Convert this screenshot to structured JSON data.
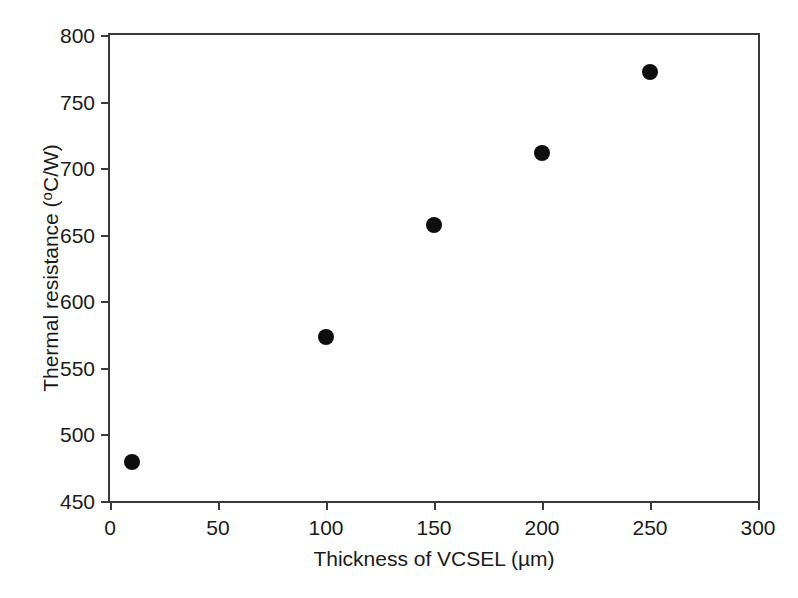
{
  "chart_data": {
    "type": "scatter",
    "title": "",
    "xlabel": "Thickness of VCSEL (µm)",
    "ylabel": "Thermal resistance (°C/W)",
    "ylabel_parts": {
      "text": "Thermal resistance (",
      "sup": "o",
      "tail": "C/W)"
    },
    "xlim": [
      0,
      300
    ],
    "ylim": [
      450,
      800
    ],
    "xticks": [
      0,
      50,
      100,
      150,
      200,
      250,
      300
    ],
    "xticklabels": [
      "0",
      "50",
      "100",
      "150",
      "200",
      "250",
      "300"
    ],
    "yticks": [
      450,
      500,
      550,
      600,
      650,
      700,
      750,
      800
    ],
    "yticklabels": [
      "450",
      "500",
      "550",
      "600",
      "650",
      "700",
      "750",
      "800"
    ],
    "grid": false,
    "legend": false,
    "legend_position": "none",
    "marker": "filled-circle",
    "marker_color": "#0d0d0d",
    "marker_size_px": 16,
    "axis_color": "#3a3a3a",
    "background_color": "#ffffff",
    "x": [
      10,
      100,
      150,
      200,
      250
    ],
    "y": [
      479,
      573,
      657,
      711,
      772
    ],
    "points": [
      {
        "x": 10,
        "y": 479
      },
      {
        "x": 100,
        "y": 573
      },
      {
        "x": 150,
        "y": 657
      },
      {
        "x": 200,
        "y": 711
      },
      {
        "x": 250,
        "y": 772
      }
    ]
  }
}
